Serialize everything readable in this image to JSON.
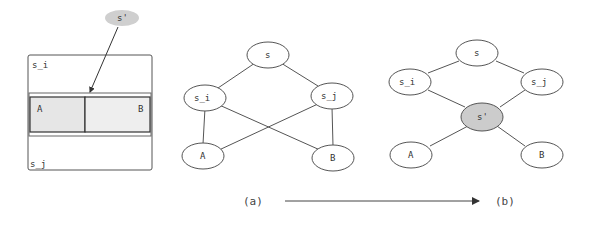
{
  "left_panel": {
    "outer_top_label": "s_i",
    "outer_bottom_label": "s_j",
    "cell_a_label": "A",
    "cell_b_label": "B",
    "inserted_node_label": "s'",
    "colors": {
      "cell_fill": "#e6e6e6",
      "inserted_fill": "#cfcfcf"
    }
  },
  "graph_a": {
    "nodes": [
      {
        "id": "s",
        "label": "s"
      },
      {
        "id": "s_i",
        "label": "s_i"
      },
      {
        "id": "s_j",
        "label": "s_j"
      },
      {
        "id": "A",
        "label": "A"
      },
      {
        "id": "B",
        "label": "B"
      }
    ],
    "edges": [
      [
        "s",
        "s_i"
      ],
      [
        "s",
        "s_j"
      ],
      [
        "s_i",
        "A"
      ],
      [
        "s_i",
        "B"
      ],
      [
        "s_j",
        "A"
      ],
      [
        "s_j",
        "B"
      ]
    ]
  },
  "graph_b": {
    "nodes": [
      {
        "id": "s",
        "label": "s"
      },
      {
        "id": "s_i",
        "label": "s_i"
      },
      {
        "id": "s_j",
        "label": "s_j"
      },
      {
        "id": "s_prime",
        "label": "s'",
        "highlight": true
      },
      {
        "id": "A",
        "label": "A"
      },
      {
        "id": "B",
        "label": "B"
      }
    ],
    "edges": [
      [
        "s",
        "s_i"
      ],
      [
        "s",
        "s_j"
      ],
      [
        "s_i",
        "s_prime"
      ],
      [
        "s_j",
        "s_prime"
      ],
      [
        "s_prime",
        "A"
      ],
      [
        "s_prime",
        "B"
      ]
    ],
    "highlight_color": "#cccccc"
  },
  "caption": {
    "from_label": "(a)",
    "to_label": "(b)"
  }
}
